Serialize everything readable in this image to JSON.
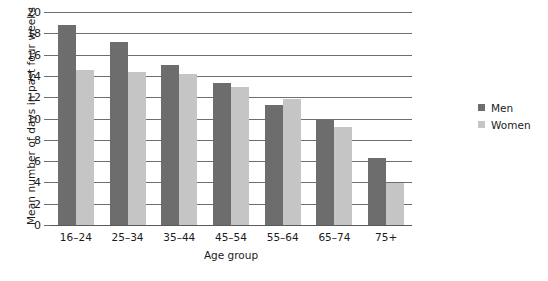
{
  "chart_data": {
    "type": "bar",
    "title": "",
    "xlabel": "Age group",
    "ylabel": "Mean number of days in past four weeks",
    "categories": [
      "16–24",
      "25–34",
      "35–44",
      "45–54",
      "55–64",
      "65–74",
      "75+"
    ],
    "series": [
      {
        "name": "Men",
        "color": "#6d6d6d",
        "values": [
          18.8,
          17.2,
          15.0,
          13.3,
          11.3,
          9.9,
          6.3
        ]
      },
      {
        "name": "Women",
        "color": "#c5c5c5",
        "values": [
          14.6,
          14.4,
          14.2,
          13.0,
          11.8,
          9.2,
          3.9
        ]
      }
    ],
    "ylim": [
      0,
      20
    ],
    "ytick_step": 2,
    "yticks": [
      "20",
      "18",
      "16",
      "14",
      "12",
      "10",
      "8",
      "6",
      "4",
      "2",
      "0"
    ],
    "grid": true,
    "legend_position": "right"
  }
}
